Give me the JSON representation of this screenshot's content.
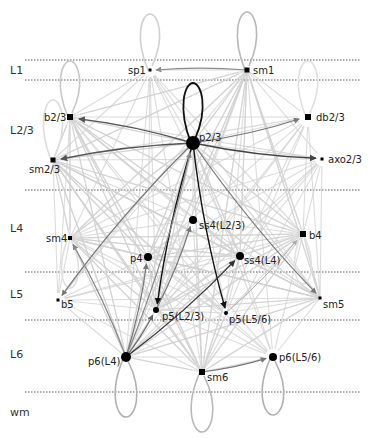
{
  "diagram": {
    "type": "cortical-connectivity-network",
    "colors": {
      "background": "#ffffff",
      "layer_line": "#555555",
      "edge_light": "#d0d0d0",
      "edge_medium": "#8a8a8a",
      "edge_dark": "#555555",
      "edge_black": "#111111",
      "node": "#000000",
      "loop_light": "#c8c8c8"
    },
    "layers": [
      {
        "label": "L1",
        "label_y": 74,
        "top": 60,
        "bottom": 80
      },
      {
        "label": "L2/3",
        "label_y": 134
      },
      {
        "label": "L4",
        "label_y": 232
      },
      {
        "label": "L5",
        "label_y": 298
      },
      {
        "label": "L6",
        "label_y": 358
      },
      {
        "label": "wm",
        "label_y": 416
      }
    ],
    "layer_lines_y": [
      60,
      80,
      190,
      272,
      320,
      392
    ],
    "nodes": [
      {
        "id": "sp1",
        "label": "sp1",
        "x": 150,
        "y": 70,
        "shape": "square",
        "size": 3,
        "label_dx": -22,
        "label_dy": 4
      },
      {
        "id": "sm1",
        "label": "sm1",
        "x": 247,
        "y": 70,
        "shape": "square",
        "size": 5,
        "label_dx": 6,
        "label_dy": 4
      },
      {
        "id": "b23",
        "label": "b2/3",
        "x": 70,
        "y": 117,
        "shape": "square",
        "size": 6,
        "label_dx": -26,
        "label_dy": 4
      },
      {
        "id": "db23",
        "label": "db2/3",
        "x": 308,
        "y": 117,
        "shape": "square",
        "size": 6,
        "label_dx": 8,
        "label_dy": 4
      },
      {
        "id": "p23",
        "label": "p2/3",
        "x": 193,
        "y": 143,
        "shape": "circle",
        "size": 7,
        "label_dx": 6,
        "label_dy": -2
      },
      {
        "id": "sm23",
        "label": "sm2/3",
        "x": 53,
        "y": 160,
        "shape": "square",
        "size": 5,
        "label_dx": -24,
        "label_dy": 13
      },
      {
        "id": "axo23",
        "label": "axo2/3",
        "x": 322,
        "y": 159,
        "shape": "square",
        "size": 3,
        "label_dx": 6,
        "label_dy": 4
      },
      {
        "id": "sm4",
        "label": "sm4",
        "x": 70,
        "y": 238,
        "shape": "square",
        "size": 4,
        "label_dx": -24,
        "label_dy": 4
      },
      {
        "id": "b4",
        "label": "b4",
        "x": 303,
        "y": 234,
        "shape": "square",
        "size": 6,
        "label_dx": 6,
        "label_dy": 5
      },
      {
        "id": "ss4L23",
        "label": "ss4(L2/3)",
        "x": 193,
        "y": 220,
        "shape": "circle",
        "size": 4,
        "label_dx": 6,
        "label_dy": 9
      },
      {
        "id": "p4",
        "label": "p4",
        "x": 148,
        "y": 257,
        "shape": "circle",
        "size": 4,
        "label_dx": -18,
        "label_dy": 5
      },
      {
        "id": "ss4L4",
        "label": "ss4(L4)",
        "x": 240,
        "y": 256,
        "shape": "circle",
        "size": 4,
        "label_dx": 4,
        "label_dy": 8
      },
      {
        "id": "b5",
        "label": "b5",
        "x": 58,
        "y": 300,
        "shape": "square",
        "size": 3,
        "label_dx": 3,
        "label_dy": 8
      },
      {
        "id": "sm5",
        "label": "sm5",
        "x": 320,
        "y": 298,
        "shape": "square",
        "size": 3,
        "label_dx": 3,
        "label_dy": 10
      },
      {
        "id": "p5L23",
        "label": "p5(L2/3)",
        "x": 156,
        "y": 310,
        "shape": "circle",
        "size": 3,
        "label_dx": 6,
        "label_dy": 10
      },
      {
        "id": "p5L56",
        "label": "p5(L5/6)",
        "x": 226,
        "y": 313,
        "shape": "circle",
        "size": 2,
        "label_dx": 3,
        "label_dy": 10
      },
      {
        "id": "p6L4",
        "label": "p6(L4)",
        "x": 126,
        "y": 357,
        "shape": "circle",
        "size": 5,
        "label_dx": -38,
        "label_dy": 8
      },
      {
        "id": "sm6",
        "label": "sm6",
        "x": 202,
        "y": 372,
        "shape": "square",
        "size": 6,
        "label_dx": 5,
        "label_dy": 9
      },
      {
        "id": "p6L56",
        "label": "p6(L5/6)",
        "x": 273,
        "y": 357,
        "shape": "circle",
        "size": 4,
        "label_dx": 6,
        "label_dy": 4
      }
    ],
    "self_loops": [
      {
        "node": "sp1",
        "dir": "up",
        "length": 56,
        "width": 16,
        "color": "#d0d0d0"
      },
      {
        "node": "sm1",
        "dir": "up",
        "length": 58,
        "width": 16,
        "color": "#b8b8b8"
      },
      {
        "node": "b23",
        "dir": "up",
        "length": 56,
        "width": 16,
        "color": "#c8c8c8"
      },
      {
        "node": "db23",
        "dir": "up",
        "length": 56,
        "width": 16,
        "color": "#e0e0e0"
      },
      {
        "node": "p23",
        "dir": "up",
        "length": 60,
        "width": 16,
        "color": "#111111"
      },
      {
        "node": "sm23",
        "dir": "up",
        "length": 60,
        "width": 16,
        "color": "#dddddd"
      },
      {
        "node": "sm4",
        "dir": "down",
        "length": 50,
        "width": 14,
        "color": "#e0e0e0"
      },
      {
        "node": "b4",
        "dir": "down",
        "length": 50,
        "width": 14,
        "color": "#e0e0e0"
      },
      {
        "node": "p6L4",
        "dir": "down",
        "length": 60,
        "width": 18,
        "color": "#b0b0b0"
      },
      {
        "node": "sm6",
        "dir": "down",
        "length": 60,
        "width": 18,
        "color": "#b8b8b8"
      },
      {
        "node": "p6L56",
        "dir": "down",
        "length": 58,
        "width": 18,
        "color": "#b0b0b0"
      }
    ],
    "strong_edges": [
      {
        "from": "p23",
        "to": "b23",
        "color": "#555555",
        "width": 1.4
      },
      {
        "from": "p23",
        "to": "db23",
        "color": "#777777",
        "width": 1.2
      },
      {
        "from": "p23",
        "to": "sm23",
        "color": "#555555",
        "width": 1.4
      },
      {
        "from": "p23",
        "to": "axo23",
        "color": "#444444",
        "width": 1.4
      },
      {
        "from": "p23",
        "to": "p5L23",
        "color": "#111111",
        "width": 1.4
      },
      {
        "from": "p23",
        "to": "p5L56",
        "color": "#111111",
        "width": 1.4
      },
      {
        "from": "p23",
        "to": "b5",
        "color": "#777777",
        "width": 1.2
      },
      {
        "from": "p23",
        "to": "sm5",
        "color": "#777777",
        "width": 1.2
      },
      {
        "from": "sm1",
        "to": "sp1",
        "color": "#8a8a8a",
        "width": 1.2
      },
      {
        "from": "p5L23",
        "to": "ss4L23",
        "color": "#777777",
        "width": 1.2
      },
      {
        "from": "p6L4",
        "to": "p4",
        "color": "#777777",
        "width": 1.2
      },
      {
        "from": "p6L4",
        "to": "sm4",
        "color": "#888888",
        "width": 1.2
      },
      {
        "from": "p6L4",
        "to": "ss4L4",
        "color": "#333333",
        "width": 1.3
      },
      {
        "from": "p6L4",
        "to": "p23",
        "color": "#888888",
        "width": 1.2
      },
      {
        "from": "p6L4",
        "to": "p5L23",
        "color": "#666666",
        "width": 1.2
      },
      {
        "from": "sm6",
        "to": "p6L56",
        "color": "#777777",
        "width": 1.2
      },
      {
        "from": "p5L56",
        "to": "b4",
        "color": "#aaaaaa",
        "width": 1.0
      }
    ]
  }
}
